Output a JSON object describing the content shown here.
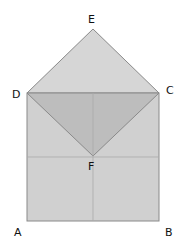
{
  "diagram": {
    "labels": {
      "E": "E",
      "D": "D",
      "C": "C",
      "F": "F",
      "A": "A",
      "B": "B"
    },
    "colors": {
      "roof": "#d6d6d6",
      "inner_triangle": "#bdbdbd",
      "square": "#d0d0d0",
      "edge": "#8a8a8a",
      "fold_line": "#b0b0b0"
    }
  }
}
